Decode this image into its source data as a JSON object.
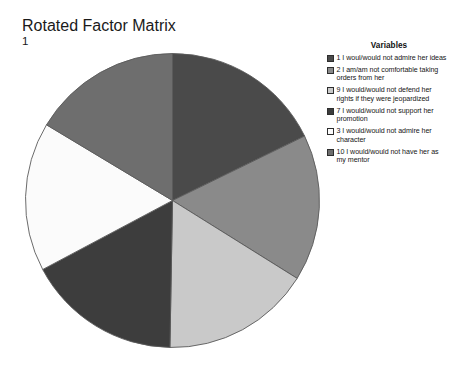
{
  "chart": {
    "title": "Rotated Factor Matrix",
    "subtitle": "1"
  },
  "legend": {
    "title": "Variables"
  },
  "chart_data": {
    "type": "pie",
    "title": "Rotated Factor Matrix",
    "subtitle": "1",
    "legend_title": "Variables",
    "legend_position": "right",
    "grid": false,
    "start_angle_deg": 0,
    "direction": "clockwise",
    "categories": [
      "1 I woul/would not admire her ideas",
      "2 I am/am not comfortable taking orders from her",
      "9 I would/would not defend her rights if they were jeopardized",
      "7 I would/would not support her promotion",
      "3 I would/would not admire her character",
      "10 I would/would not have her as my mentor"
    ],
    "values": [
      17.8,
      16.1,
      16.4,
      16.9,
      16.4,
      16.4
    ],
    "colors": [
      "#4a4a4a",
      "#8a8a8a",
      "#c9c9c9",
      "#3d3d3d",
      "#fbfbfb",
      "#6e6e6e"
    ],
    "slices": [
      {
        "label": "1 I woul/would not admire her ideas",
        "value": 17.8,
        "color": "#4a4a4a",
        "start_deg": 0,
        "end_deg": 64
      },
      {
        "label": "2 I am/am not comfortable taking orders from her",
        "value": 16.1,
        "color": "#8a8a8a",
        "start_deg": 64,
        "end_deg": 122
      },
      {
        "label": "9 I would/would not defend her rights if they were jeopardized",
        "value": 16.4,
        "color": "#c9c9c9",
        "start_deg": 122,
        "end_deg": 181
      },
      {
        "label": "7 I would/would not support her promotion",
        "value": 16.9,
        "color": "#3d3d3d",
        "start_deg": 181,
        "end_deg": 242
      },
      {
        "label": "3 I would/would not admire her character",
        "value": 16.4,
        "color": "#fbfbfb",
        "start_deg": 242,
        "end_deg": 301
      },
      {
        "label": "10 I would/would not have her as my mentor",
        "value": 16.4,
        "color": "#6e6e6e",
        "start_deg": 301,
        "end_deg": 360
      }
    ],
    "stroke_color": "#5a5a5a"
  }
}
